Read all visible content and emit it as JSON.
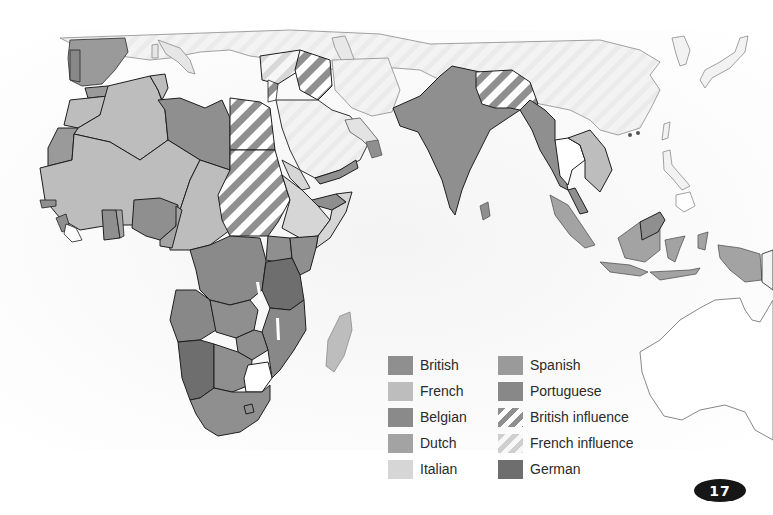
{
  "map": {
    "region": "Africa and Asia (colonial territories)",
    "colors": {
      "british": "#8f8f8f",
      "french": "#bdbdbd",
      "belgian": "#8a8a8a",
      "dutch": "#a3a3a3",
      "italian": "#d6d6d6",
      "spanish": "#9a9a9a",
      "portuguese": "#888888",
      "german": "#6e6e6e",
      "independent": "#ffffff",
      "unclaimed_land": "#ececec",
      "sea": "#f7f7f7",
      "border": "#1e1e1e"
    }
  },
  "legend": {
    "items": [
      {
        "label": "British",
        "pattern": "solid",
        "color": "#8f8f8f"
      },
      {
        "label": "French",
        "pattern": "solid",
        "color": "#bdbdbd"
      },
      {
        "label": "Belgian",
        "pattern": "solid",
        "color": "#8a8a8a"
      },
      {
        "label": "Dutch",
        "pattern": "solid",
        "color": "#a3a3a3"
      },
      {
        "label": "Italian",
        "pattern": "solid",
        "color": "#d6d6d6"
      },
      {
        "label": "Spanish",
        "pattern": "solid",
        "color": "#9a9a9a"
      },
      {
        "label": "Portuguese",
        "pattern": "solid",
        "color": "#888888"
      },
      {
        "label": "British influence",
        "pattern": "stripes",
        "color": "#8f8f8f"
      },
      {
        "label": "French influence",
        "pattern": "stripes",
        "color": "#bdbdbd"
      },
      {
        "label": "German",
        "pattern": "solid",
        "color": "#6e6e6e"
      }
    ]
  },
  "page": {
    "number": "17"
  }
}
